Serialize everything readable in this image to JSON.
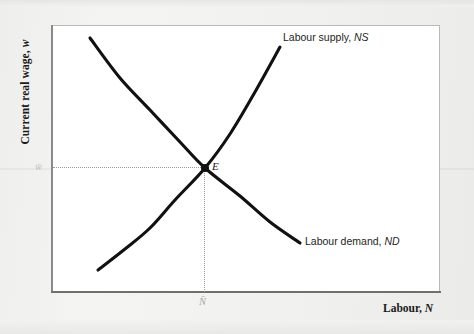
{
  "figure": {
    "kind": "labour-market-equilibrium-diagram",
    "background_color": "#f1f1ef",
    "panel_color": "#ffffff",
    "curve_color": "#111111"
  },
  "axes": {
    "y_title_text": "Current real wage, ",
    "y_title_var": "w",
    "x_title_text": "Labour, ",
    "x_title_var": "N",
    "y_tick_label": "w̄",
    "x_tick_label": "N̄"
  },
  "labels": {
    "supply_text": "Labour supply, ",
    "supply_code": "NS",
    "demand_text": "Labour demand, ",
    "demand_code": "ND",
    "equilibrium_point": "E"
  },
  "chart_data": {
    "type": "line",
    "title": "",
    "xlabel": "Labour, N",
    "ylabel": "Current real wage, w",
    "grid": false,
    "legend": "inline-curve-labels",
    "xlim": [
      51,
      440
    ],
    "ylim": [
      292,
      25
    ],
    "axis_units": "pixel-coordinates (schematic, unlabelled scales)",
    "annotations": [
      {
        "name": "equilibrium-point",
        "label": "E",
        "x": 205,
        "y": 168
      },
      {
        "name": "wage-guide",
        "label": "w̄",
        "type": "dotted-horizontal",
        "from_x": 53,
        "to_x": 205,
        "y": 168
      },
      {
        "name": "labour-guide",
        "label": "N̄",
        "type": "dotted-vertical",
        "x": 205,
        "from_y": 168,
        "to_y": 292
      }
    ],
    "series": [
      {
        "name": "Labour demand, ND",
        "slope": "downward",
        "shape": "convex-to-origin",
        "points": [
          [
            90,
            38
          ],
          [
            120,
            78
          ],
          [
            150,
            110
          ],
          [
            180,
            142
          ],
          [
            205,
            168
          ],
          [
            240,
            196
          ],
          [
            270,
            222
          ],
          [
            300,
            243
          ]
        ]
      },
      {
        "name": "Labour supply, NS",
        "slope": "upward",
        "shape": "convex",
        "points": [
          [
            98,
            270
          ],
          [
            125,
            249
          ],
          [
            150,
            228
          ],
          [
            175,
            200
          ],
          [
            205,
            168
          ],
          [
            230,
            134
          ],
          [
            255,
            92
          ],
          [
            280,
            47
          ]
        ]
      }
    ]
  }
}
